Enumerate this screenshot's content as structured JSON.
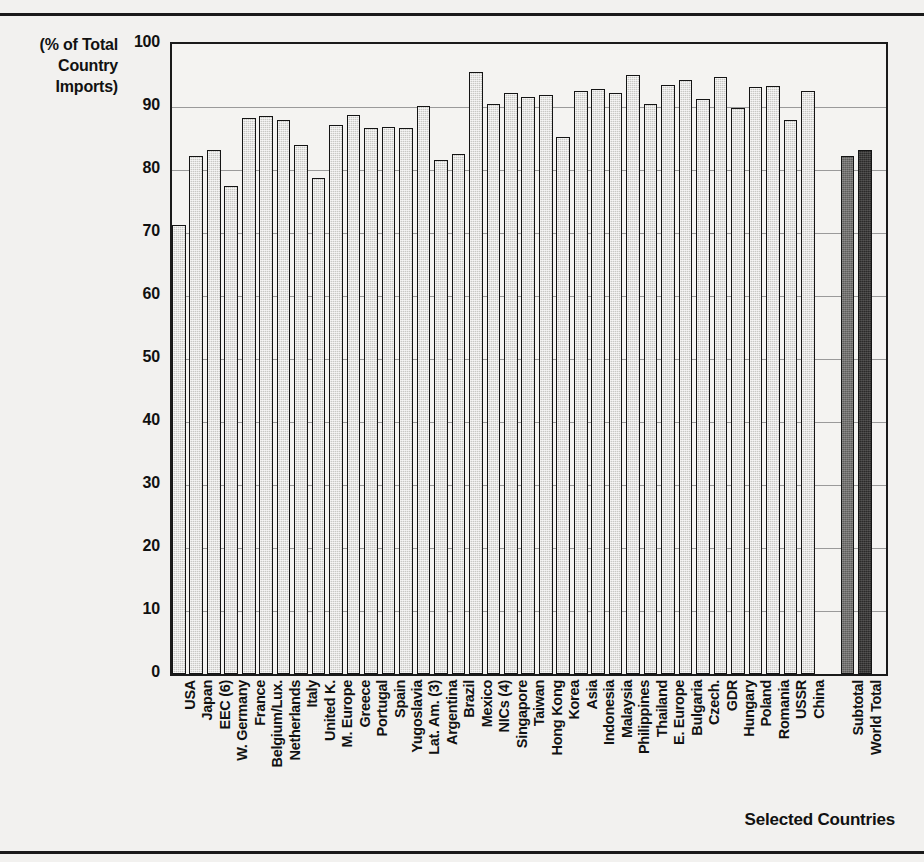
{
  "figure": {
    "y_axis_caption": "(% of Total\nCountry\nImports)",
    "y_axis_caption_lines": [
      "(% of Total",
      "Country",
      "Imports)"
    ],
    "x_axis_title": "Selected Countries"
  },
  "chart_data": {
    "type": "bar",
    "title": "",
    "subtitle": "",
    "xlabel": "Selected Countries",
    "ylabel": "(% of Total Country Imports)",
    "ylim": [
      0,
      100
    ],
    "yticks": [
      0,
      10,
      20,
      30,
      40,
      50,
      60,
      70,
      80,
      90,
      100
    ],
    "grid": true,
    "legend": "none",
    "categories": [
      "USA",
      "Japan",
      "EEC (6)",
      "W. Germany",
      "France",
      "Belgium/Lux.",
      "Netherlands",
      "Italy",
      "United K.",
      "M. Europe",
      "Greece",
      "Portugal",
      "Spain",
      "Yugoslavia",
      "Lat. Am. (3)",
      "Argentina",
      "Brazil",
      "Mexico",
      "NICs (4)",
      "Singapore",
      "Taiwan",
      "Hong Kong",
      "Korea",
      "Asia",
      "Indonesia",
      "Malaysia",
      "Philippines",
      "Thailand",
      "E. Europe",
      "Bulgaria",
      "Czech.",
      "GDR",
      "Hungary",
      "Poland",
      "Romania",
      "USSR",
      "China",
      "Subtotal",
      "World Total"
    ],
    "values": [
      71.3,
      82.2,
      83.1,
      77.4,
      88.2,
      88.6,
      88.0,
      84.0,
      78.7,
      87.2,
      88.8,
      86.7,
      86.9,
      86.6,
      90.2,
      81.6,
      82.5,
      95.6,
      90.4,
      92.3,
      91.6,
      91.9,
      85.2,
      92.6,
      92.9,
      92.2,
      95.1,
      90.5,
      93.5,
      94.3,
      91.3,
      94.8,
      89.8,
      93.2,
      93.4,
      88.0,
      92.5,
      82.2,
      83.1
    ],
    "series_styles": {
      "country": "#c9c8c5",
      "subtotal": "#5e5d5b",
      "world_total": "#2b2a29"
    }
  }
}
